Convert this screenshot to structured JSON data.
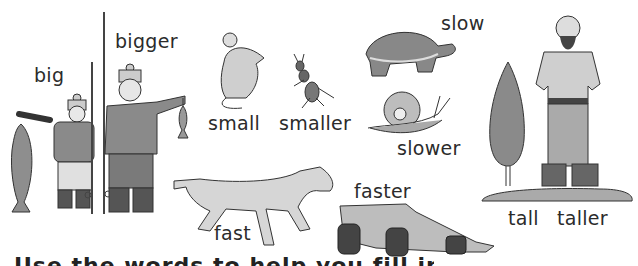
{
  "labels": {
    "big": "big",
    "bigger": "bigger",
    "small": "small",
    "smaller": "smaller",
    "slow": "slow",
    "slower": "slower",
    "tall": "tall",
    "taller": "taller",
    "fast": "fast",
    "faster": "faster"
  },
  "cut_off_text": "Use the words to help you fill in the",
  "colors": {
    "ink": "#2b2b2b",
    "gray_mid": "#8a8a8a",
    "gray_light": "#c8c8c8",
    "gray_dark": "#555555",
    "background": "#ffffff"
  }
}
